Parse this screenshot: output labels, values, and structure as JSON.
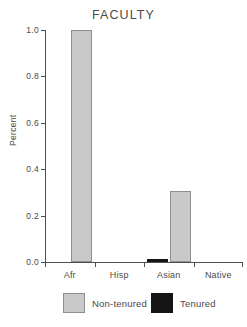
{
  "chart_data": {
    "type": "bar",
    "title": "FACULTY",
    "xlabel": "",
    "ylabel": "Percent",
    "categories": [
      "Afr",
      "Hisp",
      "Asian",
      "Native"
    ],
    "series": [
      {
        "name": "Non-tenured",
        "color": "#c9c9c9",
        "values": [
          1.0,
          0.0,
          0.305,
          0.0
        ]
      },
      {
        "name": "Tenured",
        "color": "#151515",
        "values": [
          0.0,
          0.0,
          0.015,
          0.0
        ]
      }
    ],
    "ylim": [
      0.0,
      1.0
    ],
    "yticks": [
      0.0,
      0.2,
      0.4,
      0.6,
      0.8,
      1.0
    ],
    "ytick_labels": [
      "0.0",
      "0.2",
      "0.4",
      "0.6",
      "0.8",
      "1.0"
    ],
    "grid": false,
    "legend_position": "bottom"
  },
  "legend": {
    "items": [
      {
        "label": "Non-tenured",
        "swatch": "gray-square-swatch"
      },
      {
        "label": "Tenured",
        "swatch": "black-square-swatch"
      }
    ]
  }
}
